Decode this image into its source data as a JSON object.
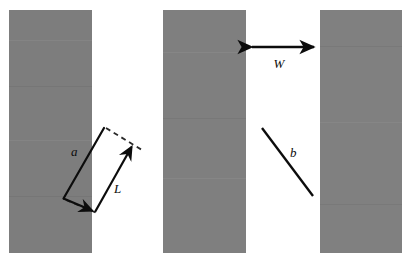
{
  "figure": {
    "background_color": "#ffffff",
    "width": 407,
    "height": 261,
    "slab_color": "#7d7d7d",
    "annotation_color": "#0c0c0c"
  },
  "slabs": [
    {
      "id": "slab-left",
      "x": 9,
      "y": 10,
      "w": 83,
      "h": 243,
      "fill": "#7d7d7d"
    },
    {
      "id": "slab-middle",
      "x": 163,
      "y": 10,
      "w": 83,
      "h": 243,
      "fill": "#7f7f7f"
    },
    {
      "id": "slab-right",
      "x": 320,
      "y": 10,
      "w": 82,
      "h": 243,
      "fill": "#808080"
    }
  ],
  "labels": {
    "a": "a",
    "L": "L",
    "W": "W",
    "b": "b"
  },
  "label_positions": {
    "a": {
      "x": 71,
      "y": 156,
      "font_size": 13
    },
    "L": {
      "x": 114,
      "y": 193,
      "font_size": 13
    },
    "W": {
      "x": 279,
      "y": 68,
      "font_size": 13
    },
    "b": {
      "x": 290,
      "y": 157,
      "font_size": 13
    }
  },
  "annotations": {
    "a_arrow": {
      "name": "a",
      "description": "solid arrow pointing down-left with arrowhead at lower end",
      "x1": 103,
      "y1": 128,
      "x2": 64,
      "y2": 198,
      "arrowhead_at": "none",
      "stroke_width": 2.1
    },
    "a_arrow_tip": {
      "name": "a-tip",
      "description": "continuation of a into arrowhead at bottom",
      "x1": 64,
      "y1": 198,
      "x2": 95,
      "y2": 211,
      "stroke_width": 2.1
    },
    "L_arrow": {
      "name": "L",
      "description": "solid arrow pointing up-right with arrowhead at upper end",
      "x1": 95,
      "y1": 212,
      "x2": 134,
      "y2": 144,
      "stroke_width": 2.1
    },
    "dash_top": {
      "name": "upper dashed extension",
      "x1": 104,
      "y1": 127,
      "x2": 143,
      "y2": 150
    },
    "dash_bottom": {
      "name": "lower dashed extension",
      "x1": 64,
      "y1": 199,
      "x2": 99,
      "y2": 214
    },
    "W_arrow": {
      "name": "W",
      "description": "double-headed horizontal arrow spanning gap between middle and right slab",
      "x1": 248,
      "y1": 47,
      "x2": 318,
      "y2": 47,
      "arrowhead_at": "both",
      "stroke_width": 2.4
    },
    "b_line": {
      "name": "b",
      "description": "plain diagonal line segment, no arrowheads",
      "x1": 262,
      "y1": 128,
      "x2": 313,
      "y2": 196,
      "arrowhead_at": "none",
      "stroke_width": 2.2
    }
  }
}
